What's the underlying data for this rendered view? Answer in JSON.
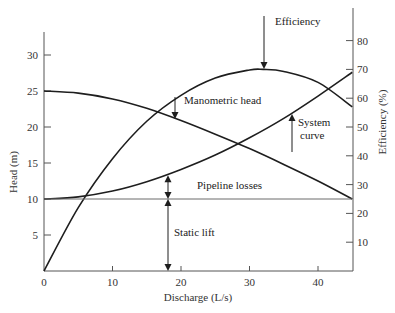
{
  "chart_data": {
    "type": "line",
    "title": "",
    "xlabel": "Discharge (L/s)",
    "ylabel": "Head (m)",
    "y2label": "Efficiency (%)",
    "xlim": [
      0,
      45
    ],
    "ylim": [
      0,
      33
    ],
    "y2lim": [
      0,
      90
    ],
    "grid": false,
    "x_ticks": [
      0,
      10,
      20,
      30,
      40
    ],
    "y_ticks": [
      5,
      10,
      15,
      20,
      25,
      30
    ],
    "y2_ticks": [
      10,
      20,
      30,
      40,
      50,
      60,
      70,
      80
    ],
    "series": [
      {
        "name": "Manometric head",
        "axis": "left",
        "x": [
          0,
          5,
          10,
          15,
          20,
          25,
          30,
          35,
          40,
          45
        ],
        "values": [
          25,
          24.7,
          23.9,
          22.6,
          20.9,
          19.0,
          17.0,
          14.8,
          12.5,
          10.0
        ]
      },
      {
        "name": "System curve",
        "axis": "left",
        "x": [
          0,
          5,
          10,
          15,
          20,
          25,
          30,
          35,
          40,
          45
        ],
        "values": [
          10,
          10.3,
          11.1,
          12.4,
          14.1,
          16.1,
          18.5,
          21.2,
          24.3,
          27.6
        ]
      },
      {
        "name": "Efficiency",
        "axis": "right",
        "x": [
          0,
          5,
          10,
          15,
          20,
          25,
          30,
          32,
          35,
          40,
          45
        ],
        "values": [
          0,
          22,
          39,
          52,
          61,
          67,
          69.8,
          70,
          69.3,
          65.5,
          57
        ]
      },
      {
        "name": "Static lift",
        "axis": "left",
        "x": [
          0,
          45
        ],
        "values": [
          10,
          10
        ]
      }
    ],
    "annotations": [
      {
        "text": "Efficiency",
        "x": 32,
        "target": "Efficiency",
        "arrow": "down"
      },
      {
        "text": "Manometric head",
        "x": 19,
        "target": "Manometric head",
        "arrow": "down"
      },
      {
        "text": "System",
        "text2": "curve",
        "x": 36,
        "target": "System curve",
        "arrow": "up"
      },
      {
        "text": "Pipeline losses",
        "x": 18,
        "between": [
          10,
          13.2
        ],
        "arrow": "double"
      },
      {
        "text": "Static lift",
        "x": 18,
        "between": [
          0,
          10
        ],
        "arrow": "double"
      }
    ]
  },
  "labels": {
    "xlabel": "Discharge (L/s)",
    "ylabel": "Head (m)",
    "y2label": "Efficiency (%)",
    "efficiency": "Efficiency",
    "manometric": "Manometric head",
    "system1": "System",
    "system2": "curve",
    "pipeline": "Pipeline losses",
    "static": "Static lift"
  },
  "colors": {
    "line": "#1e1e1e",
    "axis": "#555555",
    "static": "#6a6a6a"
  }
}
